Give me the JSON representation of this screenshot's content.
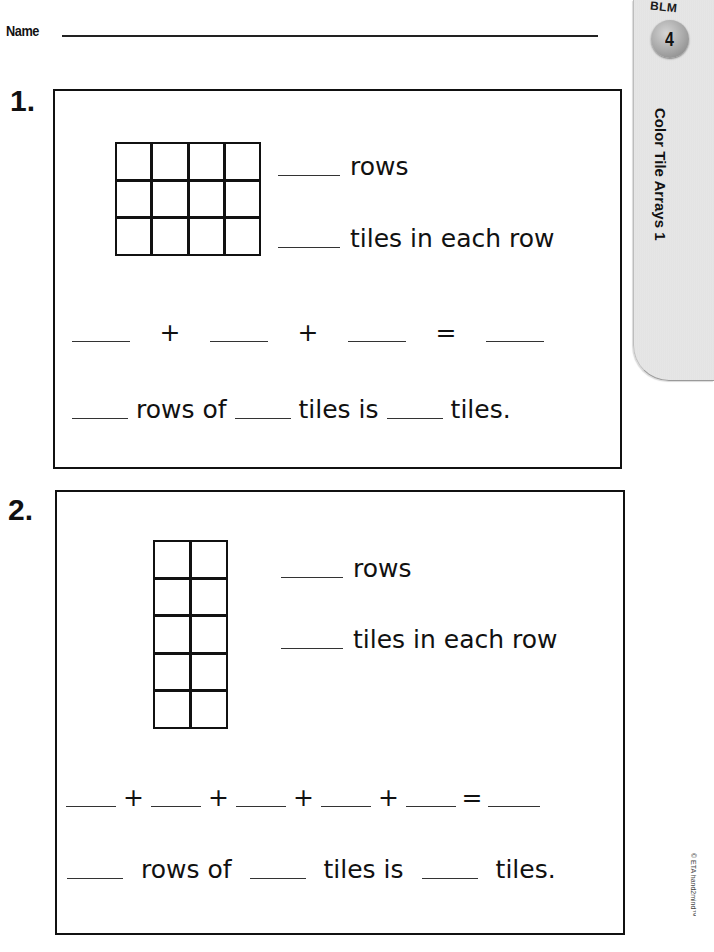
{
  "header": {
    "name_label": "Name"
  },
  "side_tab": {
    "blm_label": "BLM",
    "blm_number": "4",
    "title": "Color Tile Arrays 1",
    "background_color": "#e4e4e4",
    "badge_color": "#a7a7a7"
  },
  "footer": {
    "copyright": "© ETA hand2mind™"
  },
  "problems": [
    {
      "number": "1.",
      "grid": {
        "rows": 3,
        "columns": 4
      },
      "prompts": {
        "rows_label": "rows",
        "tiles_label": "tiles in each row"
      },
      "equation": {
        "operators": [
          "+",
          "+",
          "="
        ],
        "blank_count": 4
      },
      "sentence": {
        "part1": "rows of",
        "part2": "tiles is",
        "part3": "tiles."
      }
    },
    {
      "number": "2.",
      "grid": {
        "rows": 5,
        "columns": 2
      },
      "prompts": {
        "rows_label": "rows",
        "tiles_label": "tiles in each row"
      },
      "equation": {
        "operators": [
          "+",
          "+",
          "+",
          "+",
          "="
        ],
        "blank_count": 6
      },
      "sentence": {
        "part1": "rows of",
        "part2": "tiles is",
        "part3": "tiles."
      }
    }
  ]
}
